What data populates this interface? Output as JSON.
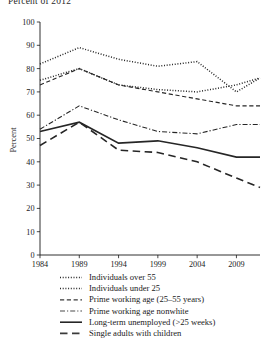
{
  "figure": {
    "title_partial": "Percent of 2012",
    "ylabel": "Percent",
    "xlabel": ""
  },
  "chart_data": {
    "type": "line",
    "title": "Percent of 2012",
    "xlabel": "",
    "ylabel": "Percent",
    "xlim": [
      1984,
      2012
    ],
    "ylim": [
      0,
      100
    ],
    "xticks": [
      1984,
      1989,
      1994,
      1999,
      2004,
      2009
    ],
    "yticks": [
      0,
      10,
      20,
      30,
      40,
      50,
      60,
      70,
      80,
      90,
      100
    ],
    "grid": false,
    "legend_position": "below",
    "x": [
      1984,
      1989,
      1994,
      1999,
      2004,
      2009,
      2012
    ],
    "series": [
      {
        "name": "Individuals over 55",
        "style": "dotted",
        "color": "#262626",
        "values": [
          82,
          89,
          84,
          81,
          83,
          70,
          76
        ]
      },
      {
        "name": "Individuals under 25",
        "style": "dotted",
        "color": "#262626",
        "values": [
          75,
          80,
          73,
          71,
          70,
          73,
          76
        ]
      },
      {
        "name": "Prime working age (25–55 years)",
        "style": "dashed",
        "color": "#3a3a3a",
        "values": [
          73,
          80,
          73,
          70,
          67,
          64,
          64
        ]
      },
      {
        "name": "Prime working age nonwhite",
        "style": "dash-dot",
        "color": "#4a4a4a",
        "values": [
          54,
          64,
          58,
          53,
          52,
          56,
          56
        ]
      },
      {
        "name": "Long-term unemployed (>25 weeks)",
        "style": "solid",
        "color": "#262626",
        "values": [
          53,
          57,
          48,
          49,
          46,
          42,
          42
        ]
      },
      {
        "name": "Single adults with children",
        "style": "long-dash",
        "color": "#3a3a3a",
        "values": [
          47,
          57,
          45,
          44,
          40,
          33,
          29
        ]
      }
    ]
  },
  "legend": {
    "items": [
      {
        "label": "Individuals over 55",
        "swatch": "dotted-line-swatch"
      },
      {
        "label": "Individuals under 25",
        "swatch": "dotted-line-swatch"
      },
      {
        "label": "Prime working age (25–55 years)",
        "swatch": "dashed-line-swatch"
      },
      {
        "label": "Prime working age nonwhite",
        "swatch": "dash-dot-line-swatch"
      },
      {
        "label": "Long-term unemployed (>25 weeks)",
        "swatch": "solid-line-swatch"
      },
      {
        "label": "Single adults with children",
        "swatch": "long-dash-line-swatch"
      }
    ]
  }
}
